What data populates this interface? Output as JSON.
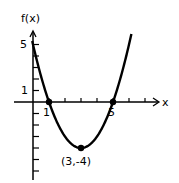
{
  "chart_data": {
    "type": "line",
    "title": "",
    "function": "f(x) = (x-3)^2 - 4",
    "xlabel": "x",
    "ylabel": "f(x)",
    "x_tick_labels": [
      "1",
      "5"
    ],
    "y_tick_labels": [
      "5",
      "1"
    ],
    "xlim": [
      0,
      8
    ],
    "ylim": [
      -6.5,
      6
    ],
    "grid": false,
    "series": [
      {
        "name": "f(x)",
        "x": [
          -0.1,
          0,
          1,
          2,
          3,
          4,
          5,
          6,
          6.1
        ],
        "values": [
          5.61,
          5,
          0,
          -3,
          -4,
          -3,
          0,
          5,
          5.61
        ]
      }
    ],
    "points": [
      {
        "x": 1,
        "y": 0
      },
      {
        "x": 3,
        "y": -4,
        "label": "(3,-4)"
      },
      {
        "x": 5,
        "y": 0
      }
    ],
    "annotations": [
      "(3,-4)"
    ]
  },
  "labels": {
    "y_axis": "f(x)",
    "x_axis": "x",
    "tick_5_y": "5",
    "tick_1_y": "1",
    "tick_1_x": "1",
    "tick_5_x": "5",
    "vertex": "(3,-4)"
  }
}
